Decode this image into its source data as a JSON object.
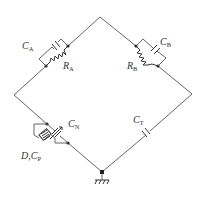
{
  "diagram": {
    "type": "bridge-circuit",
    "colors": {
      "wire": "#555555",
      "component": "#333333",
      "node": "#222222",
      "background": "#ffffff"
    },
    "vertices": {
      "top": [
        100,
        17
      ],
      "left": [
        14,
        95
      ],
      "right": [
        192,
        94
      ],
      "bottom": [
        102,
        172
      ]
    },
    "components": [
      {
        "id": "CA",
        "kind": "capacitor",
        "branch": "top-left",
        "label_main": "C",
        "label_sub": "A"
      },
      {
        "id": "RA",
        "kind": "resistor",
        "branch": "top-left",
        "label_main": "R",
        "label_sub": "A"
      },
      {
        "id": "CB",
        "kind": "capacitor",
        "branch": "top-right",
        "label_main": "C",
        "label_sub": "B"
      },
      {
        "id": "RB",
        "kind": "resistor",
        "branch": "top-right",
        "label_main": "R",
        "label_sub": "B"
      },
      {
        "id": "CN",
        "kind": "variable-capacitor",
        "branch": "bottom-left",
        "label_main": "C",
        "label_sub": "N"
      },
      {
        "id": "DCP",
        "kind": "test-specimen",
        "branch": "bottom-left",
        "label_main": "D,C",
        "label_sub": "P"
      },
      {
        "id": "CT",
        "kind": "capacitor",
        "branch": "bottom-right",
        "label_main": "C",
        "label_sub": "T"
      }
    ],
    "ground": {
      "position": "bottom",
      "icon": "ground-icon"
    }
  }
}
